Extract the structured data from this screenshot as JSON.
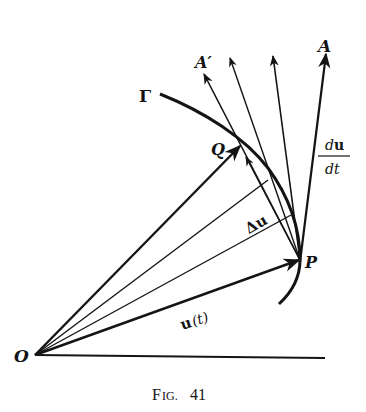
{
  "figure": {
    "caption_prefix": "F",
    "caption_small": "IG.",
    "caption_number": "41",
    "background": "#ffffff",
    "ink": "#141414"
  },
  "labels": {
    "origin": "O",
    "curve": "Γ",
    "point_p": "P",
    "point_q": "Q",
    "tangent_a": "A",
    "secant_a_prime": "A′",
    "vector_u": "u",
    "vector_u_arg": "(t)",
    "delta_u": "Δu",
    "deriv_num_d": "d",
    "deriv_num_u": "u",
    "deriv_den": "dt"
  },
  "geometry": {
    "origin": [
      35,
      355
    ],
    "P": [
      300,
      260
    ],
    "Q": [
      240,
      145
    ],
    "intermediate_points": [
      [
        268,
        180
      ],
      [
        290,
        215
      ]
    ],
    "secant_tips": [
      [
        205,
        75
      ],
      [
        230,
        60
      ],
      [
        273,
        57
      ]
    ],
    "tangent_tip": [
      326,
      50
    ],
    "baseline_end": [
      325,
      358
    ]
  }
}
